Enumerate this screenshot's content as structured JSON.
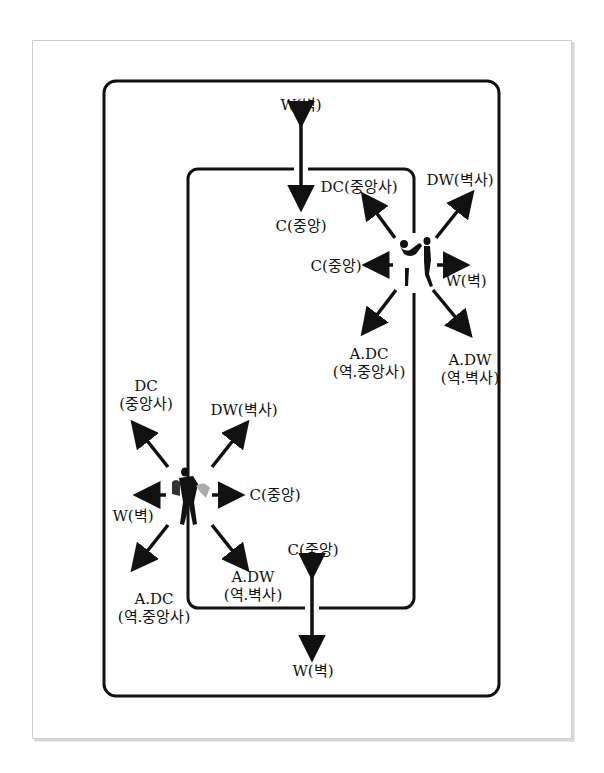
{
  "diagram": {
    "colors": {
      "line": "#111111",
      "frame": "#cfcfcf",
      "background": "#ffffff"
    }
  },
  "top_center_arrow": {
    "top_label": "W(벽)",
    "bottom_label": "C(중앙)"
  },
  "upper_right_dancers": {
    "figure": "couple-silhouette",
    "labels": {
      "dc": "DC(중앙사)",
      "dw": "DW(벽사)",
      "c": "C(중앙)",
      "w": "W(벽)",
      "adc_line1": "A.DC",
      "adc_line2": "(역.중앙사)",
      "adw_line1": "A.DW",
      "adw_line2": "(역.벽사)"
    }
  },
  "lower_left_dancers": {
    "figure": "couple-silhouette",
    "labels": {
      "dc_line1": "DC",
      "dc_line2": "(중앙사)",
      "dw": "DW(벽사)",
      "c": "C(중앙)",
      "w": "W(벽)",
      "adc_line1": "A.DC",
      "adc_line2": "(역.중앙사)",
      "adw_line1": "A.DW",
      "adw_line2": "(역.벽사)"
    }
  },
  "bottom_center_arrow": {
    "top_label": "C(중앙)",
    "bottom_label": "W(벽)"
  }
}
